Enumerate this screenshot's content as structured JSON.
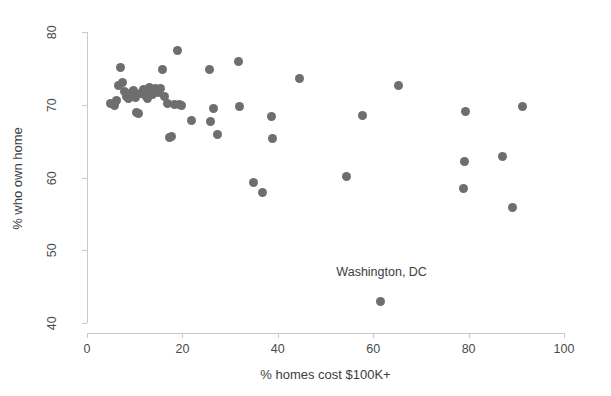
{
  "chart_data": {
    "type": "scatter",
    "title": "",
    "subtitle": "",
    "xlabel": "% homes cost $100K+",
    "ylabel": "% who own home",
    "xlim": [
      0,
      100
    ],
    "ylim": [
      40,
      80
    ],
    "xticks": [
      0,
      20,
      40,
      60,
      80,
      100
    ],
    "yticks": [
      40,
      50,
      60,
      70,
      80
    ],
    "grid": false,
    "legend": null,
    "marker_color": "#6e6e6e",
    "marker_size_px": 9,
    "axis_color": "#c9c9c9",
    "background_color": "#ffffff",
    "annotations": [
      {
        "text": "Washington, DC",
        "x": 61.5,
        "y": 47.0,
        "points_to_x": 61.6,
        "points_to_y": 42.9
      }
    ],
    "points": [
      {
        "x": 5.0,
        "y": 70.2
      },
      {
        "x": 5.7,
        "y": 69.9
      },
      {
        "x": 6.1,
        "y": 70.6
      },
      {
        "x": 6.6,
        "y": 72.6
      },
      {
        "x": 7.1,
        "y": 75.1
      },
      {
        "x": 7.5,
        "y": 73.0
      },
      {
        "x": 7.9,
        "y": 71.8
      },
      {
        "x": 8.2,
        "y": 71.2
      },
      {
        "x": 8.6,
        "y": 70.9
      },
      {
        "x": 9.2,
        "y": 71.5
      },
      {
        "x": 9.7,
        "y": 72.0
      },
      {
        "x": 10.1,
        "y": 71.0
      },
      {
        "x": 10.4,
        "y": 68.9
      },
      {
        "x": 10.9,
        "y": 68.8
      },
      {
        "x": 11.3,
        "y": 71.6
      },
      {
        "x": 11.8,
        "y": 72.1
      },
      {
        "x": 12.2,
        "y": 71.3
      },
      {
        "x": 12.6,
        "y": 70.8
      },
      {
        "x": 13.0,
        "y": 72.4
      },
      {
        "x": 13.4,
        "y": 71.9
      },
      {
        "x": 13.8,
        "y": 71.4
      },
      {
        "x": 14.3,
        "y": 72.2
      },
      {
        "x": 14.9,
        "y": 71.7
      },
      {
        "x": 15.4,
        "y": 72.3
      },
      {
        "x": 15.9,
        "y": 74.8
      },
      {
        "x": 16.3,
        "y": 71.1
      },
      {
        "x": 16.8,
        "y": 70.2
      },
      {
        "x": 17.2,
        "y": 65.5
      },
      {
        "x": 17.8,
        "y": 65.7
      },
      {
        "x": 18.4,
        "y": 70.1
      },
      {
        "x": 18.9,
        "y": 77.5
      },
      {
        "x": 19.3,
        "y": 70.0
      },
      {
        "x": 19.9,
        "y": 69.9
      },
      {
        "x": 22.0,
        "y": 67.8
      },
      {
        "x": 25.6,
        "y": 74.9
      },
      {
        "x": 25.8,
        "y": 67.7
      },
      {
        "x": 26.5,
        "y": 69.5
      },
      {
        "x": 27.3,
        "y": 65.9
      },
      {
        "x": 31.7,
        "y": 76.0
      },
      {
        "x": 31.9,
        "y": 69.7
      },
      {
        "x": 34.9,
        "y": 59.3
      },
      {
        "x": 36.8,
        "y": 58.0
      },
      {
        "x": 38.6,
        "y": 68.4
      },
      {
        "x": 38.8,
        "y": 65.4
      },
      {
        "x": 44.6,
        "y": 73.6
      },
      {
        "x": 54.3,
        "y": 60.2
      },
      {
        "x": 57.8,
        "y": 68.5
      },
      {
        "x": 61.6,
        "y": 42.9
      },
      {
        "x": 65.4,
        "y": 72.7
      },
      {
        "x": 78.9,
        "y": 58.5
      },
      {
        "x": 79.2,
        "y": 62.2
      },
      {
        "x": 79.4,
        "y": 69.1
      },
      {
        "x": 87.1,
        "y": 62.9
      },
      {
        "x": 89.1,
        "y": 55.9
      },
      {
        "x": 91.2,
        "y": 69.7
      }
    ]
  }
}
